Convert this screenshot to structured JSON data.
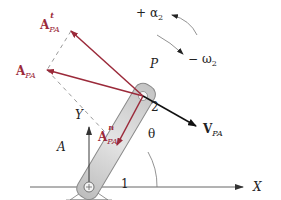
{
  "diagram": {
    "colors": {
      "acceleration": "#9b2a3a",
      "velocity": "#111111",
      "link_fill": "#d4d4d4",
      "link_stroke": "#8a8a8a",
      "axis": "#555555",
      "dashed": "#9a9a9a"
    },
    "points": {
      "A": {
        "label": "A",
        "x": 89,
        "y": 187
      },
      "P": {
        "label": "P",
        "x": 143,
        "y": 96
      }
    },
    "links": [
      {
        "id": "2",
        "label": "2",
        "from": "A",
        "to": "P"
      },
      {
        "id": "1",
        "label": "1",
        "type": "ground"
      }
    ],
    "vectors": [
      {
        "id": "A_PA_t",
        "main": "A",
        "sub": "PA",
        "sup": "t",
        "color": "acceleration",
        "from": "P",
        "to": [
          71,
          31
        ]
      },
      {
        "id": "A_PA",
        "main": "A",
        "sub": "PA",
        "sup": "",
        "color": "acceleration",
        "from": "P",
        "to": [
          47,
          70
        ]
      },
      {
        "id": "A_PA_n",
        "main": "A",
        "sub": "PA",
        "sup": "n",
        "color": "acceleration",
        "from": "P",
        "to": [
          117,
          145
        ]
      },
      {
        "id": "V_PA",
        "main": "V",
        "sub": "PA",
        "sup": "",
        "color": "velocity",
        "from": "P",
        "to": [
          196,
          126
        ]
      }
    ],
    "axes": {
      "x_label": "X",
      "y_label": "Y"
    },
    "angle": {
      "label": "θ"
    },
    "rotation": {
      "alpha": {
        "sign": "+",
        "symbol": "α",
        "sub": "2"
      },
      "omega": {
        "sign": "−",
        "symbol": "ω",
        "sub": "2"
      }
    }
  }
}
